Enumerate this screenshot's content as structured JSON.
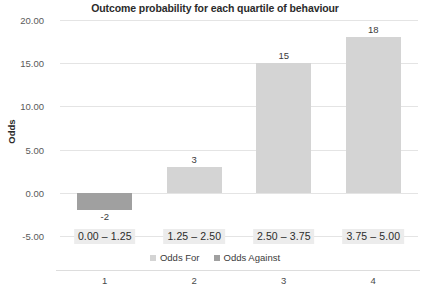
{
  "chart_data": {
    "type": "bar",
    "title": "Outcome probability for each quartile of behaviour",
    "xlabel": "",
    "ylabel": "Odds",
    "categories": [
      "0.00 – 1.25",
      "1.25 – 2.50",
      "2.50 – 3.75",
      "3.75 – 5.00"
    ],
    "tier_labels": [
      "1",
      "2",
      "3",
      "4"
    ],
    "values": [
      -2,
      3,
      15,
      18
    ],
    "value_labels": [
      "-2",
      "3",
      "15",
      "18"
    ],
    "bar_series": [
      "Odds Against",
      "Odds For",
      "Odds For",
      "Odds For"
    ],
    "ylim": [
      -5,
      20
    ],
    "yticks": [
      20,
      15,
      10,
      5,
      0,
      -5
    ],
    "ytick_labels": [
      "20.00",
      "15.00",
      "10.00",
      "5.00",
      "0.00",
      "-5.00"
    ],
    "grid": true,
    "legend_position": "bottom",
    "series": [
      {
        "name": "Odds For",
        "color": "#d4d4d4"
      },
      {
        "name": "Odds Against",
        "color": "#a0a0a0"
      }
    ]
  },
  "legend": {
    "items": [
      {
        "label": "Odds For",
        "color": "#d4d4d4"
      },
      {
        "label": "Odds Against",
        "color": "#a0a0a0"
      }
    ]
  },
  "colors": {
    "odds_for": "#d4d4d4",
    "odds_against": "#a0a0a0",
    "gridline": "#e4e4e4",
    "label_highlight": "#ececec",
    "text": "#2b2b2b"
  }
}
